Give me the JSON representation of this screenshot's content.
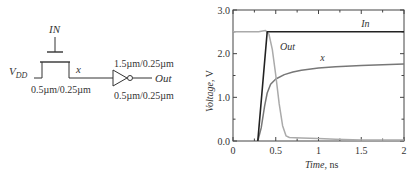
{
  "schematic": {
    "gate_label": "IN",
    "supply_label": "V",
    "supply_sub": "DD",
    "node_label": "x",
    "pass_transistor_size": "0.5µm/0.25µm",
    "inverter_pmos_size": "1.5µm/0.25µm",
    "inverter_nmos_size": "0.5µm/0.25µm",
    "output_label": "Out"
  },
  "chart_data": {
    "type": "line",
    "title": "",
    "xlabel": "Time, ns",
    "xlabel_italic": "Time",
    "xlabel_unit": ", ns",
    "ylabel": "Voltage, V",
    "ylabel_italic": "Voltage",
    "ylabel_unit": ", V",
    "xlim": [
      0,
      2
    ],
    "ylim": [
      0,
      3
    ],
    "x_ticks": [
      "0",
      "0.5",
      "1",
      "1.5",
      "2"
    ],
    "y_ticks": [
      "0.0",
      "1.0",
      "2.0",
      "3.0"
    ],
    "grid": false,
    "series": [
      {
        "name": "In",
        "color": "#222222",
        "x": [
          0.29,
          0.4,
          2.0
        ],
        "y": [
          0.0,
          2.5,
          2.5
        ]
      },
      {
        "name": "Out",
        "color": "#aaaaaa",
        "x": [
          0,
          0.3,
          0.38,
          0.42,
          0.46,
          0.5,
          0.54,
          0.58,
          0.62,
          0.66,
          0.8,
          1.0,
          1.2,
          1.5,
          2.0
        ],
        "y": [
          2.5,
          2.5,
          2.53,
          2.45,
          2.1,
          1.5,
          0.85,
          0.35,
          0.12,
          0.08,
          0.07,
          0.06,
          0.04,
          0.02,
          0.02
        ]
      },
      {
        "name": "x",
        "color": "#777777",
        "x": [
          0.29,
          0.33,
          0.37,
          0.4,
          0.44,
          0.5,
          0.6,
          0.7,
          0.8,
          1.0,
          1.2,
          1.5,
          2.0
        ],
        "y": [
          0.0,
          0.3,
          0.8,
          1.1,
          1.3,
          1.42,
          1.52,
          1.58,
          1.62,
          1.67,
          1.7,
          1.73,
          1.76
        ]
      }
    ],
    "annotations": [
      {
        "text": "In",
        "x": 1.5,
        "y": 2.62
      },
      {
        "text": "Out",
        "x": 0.55,
        "y": 2.08
      },
      {
        "text": "x",
        "x": 1.02,
        "y": 1.83
      }
    ]
  }
}
